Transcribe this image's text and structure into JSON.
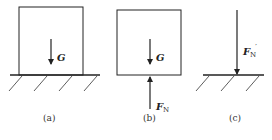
{
  "panels": [
    {
      "id": "a",
      "caption": "(a)",
      "description": "Block resting on ground with weight G",
      "forces": [
        {
          "symbol": "G",
          "subscript": "",
          "prime": "",
          "direction": "down"
        }
      ]
    },
    {
      "id": "b",
      "caption": "(b)",
      "description": "Free-body diagram of block",
      "forces": [
        {
          "symbol": "G",
          "subscript": "",
          "prime": "",
          "direction": "down"
        },
        {
          "symbol": "F",
          "subscript": "N",
          "prime": "",
          "direction": "up"
        }
      ]
    },
    {
      "id": "c",
      "caption": "(c)",
      "description": "Reaction force on ground",
      "forces": [
        {
          "symbol": "F",
          "subscript": "N",
          "prime": "′",
          "direction": "down"
        }
      ]
    }
  ],
  "colors": {
    "stroke": "#222222",
    "background": "#ffffff"
  }
}
